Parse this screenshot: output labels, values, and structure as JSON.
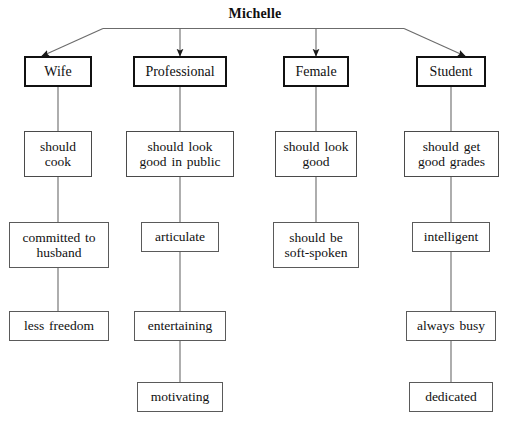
{
  "diagram": {
    "type": "hierarchy-tree",
    "root": {
      "label": "Michelle"
    },
    "branches": [
      {
        "role": "Wife",
        "attributes": [
          "should\ncook",
          "committed  to\nhusband",
          "less  freedom"
        ]
      },
      {
        "role": "Professional",
        "attributes": [
          "should  look\ngood  in  public",
          "articulate",
          "entertaining",
          "motivating"
        ]
      },
      {
        "role": "Female",
        "attributes": [
          "should  look\ngood",
          "should  be\nsoft-spoken"
        ]
      },
      {
        "role": "Student",
        "attributes": [
          "should  get\ngood  grades",
          "intelligent",
          "always  busy",
          "dedicated"
        ]
      }
    ],
    "colors": {
      "background": "#ffffff",
      "box_border_root_level": "#111111",
      "box_border": "#5a5a5a",
      "connector": "#6b6b6b",
      "arrow": "#1a1a1a",
      "text": "#101010"
    }
  }
}
